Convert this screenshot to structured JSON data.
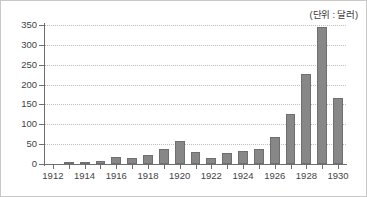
{
  "figure": {
    "unit_label": "(단위 : 달러)",
    "bar_color": "#878787",
    "bar_border_color": "#6f6f6f",
    "axis_color": "#6e6e6e",
    "grid_color": "#bdbdbd",
    "border_color": "#c8c8c8"
  },
  "chart_data": {
    "type": "bar",
    "title": "",
    "subtitle": "",
    "xlabel": "",
    "ylabel": "",
    "annotations": [
      "(단위 : 달러)"
    ],
    "legend": [],
    "legend_position": "none",
    "grid": true,
    "grid_axis": "y",
    "grid_style": "dotted",
    "ylim": [
      0,
      350
    ],
    "ytick_step": 50,
    "yticks": [
      0,
      50,
      100,
      150,
      200,
      250,
      300,
      350
    ],
    "ytick_labels": [
      "0",
      "50",
      "100",
      "150",
      "200",
      "250",
      "300",
      "350"
    ],
    "xlim": [
      1911.5,
      1930.5
    ],
    "xtick_labels": [
      "1912",
      "1914",
      "1916",
      "1918",
      "1920",
      "1922",
      "1924",
      "1926",
      "1928",
      "1930"
    ],
    "xtick_values": [
      1912,
      1914,
      1916,
      1918,
      1920,
      1922,
      1924,
      1926,
      1928,
      1930
    ],
    "minor_ticks_every_year": true,
    "categories": [
      1912,
      1913,
      1914,
      1915,
      1916,
      1917,
      1918,
      1919,
      1920,
      1921,
      1922,
      1923,
      1924,
      1925,
      1926,
      1927,
      1928,
      1929,
      1930
    ],
    "values": [
      0,
      1,
      2,
      8,
      18,
      16,
      23,
      38,
      57,
      29,
      16,
      27,
      33,
      38,
      67,
      126,
      227,
      345,
      166
    ]
  }
}
